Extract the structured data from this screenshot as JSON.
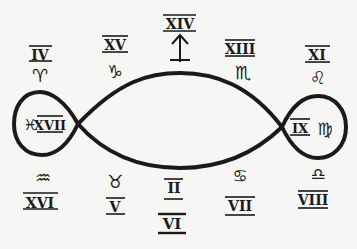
{
  "diagram": {
    "type": "lemniscate-zodiac",
    "colors": {
      "ink": "#1a1a1a",
      "background": "#f6f6f4"
    },
    "top_labels": [
      {
        "numeral": "IV",
        "sign": "Aries",
        "glyph": "♈"
      },
      {
        "numeral": "XV",
        "sign": "Capricorn",
        "glyph": "♑"
      },
      {
        "numeral": "XIV",
        "sign": "",
        "glyph": "↑"
      },
      {
        "numeral": "XIII",
        "sign": "Scorpio",
        "glyph": "♏"
      },
      {
        "numeral": "XI",
        "sign": "Leo",
        "glyph": "♌"
      }
    ],
    "left_loop": {
      "numeral": "XVII",
      "sign": "Pisces",
      "glyph": "♓"
    },
    "right_loop": {
      "numeral": "IX",
      "sign": "Virgo",
      "glyph": "♍"
    },
    "bottom_labels": [
      {
        "numeral": "XVI",
        "sign": "Aquarius",
        "glyph": "♒"
      },
      {
        "numeral": "V",
        "sign": "Taurus",
        "glyph": "♉"
      },
      {
        "numeral": "II",
        "sign": "",
        "glyph": ""
      },
      {
        "numeral": "VI",
        "sign": "",
        "glyph": ""
      },
      {
        "numeral": "VII",
        "sign": "Cancer",
        "glyph": "♋"
      },
      {
        "numeral": "VIII",
        "sign": "Libra",
        "glyph": "♎"
      }
    ]
  }
}
